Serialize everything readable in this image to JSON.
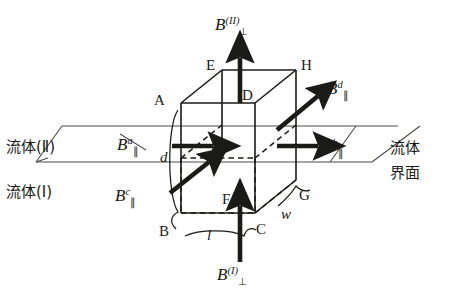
{
  "figure": {
    "ink_color": "#1a1a16"
  },
  "fields": {
    "perp_top": {
      "base": "B",
      "superscript": "(II)",
      "subscript": "⊥",
      "direction": "up"
    },
    "perp_bottom": {
      "base": "B",
      "superscript": "(I)",
      "subscript": "⊥",
      "direction": "up"
    },
    "par_a": {
      "base": "B",
      "superscript": "a",
      "subscript": "∥",
      "direction": "right"
    },
    "par_b": {
      "base": "B",
      "superscript": "b",
      "subscript": "∥",
      "direction": "right"
    },
    "par_c": {
      "base": "B",
      "superscript": "c",
      "subscript": "∥",
      "direction": "up-right"
    },
    "par_d": {
      "base": "B",
      "superscript": "d",
      "subscript": "∥",
      "direction": "up-right"
    }
  },
  "vertices": {
    "A": "A",
    "B": "B",
    "C": "C",
    "D": "D",
    "E": "E",
    "F": "F",
    "G": "G",
    "H": "H"
  },
  "dimensions": {
    "length": "l",
    "width": "w",
    "depth": "d"
  },
  "annotations": {
    "fluid_two": "流体(Ⅱ)",
    "fluid_one": "流体(Ⅰ)",
    "interface_line1": "流体",
    "interface_line2": "界面"
  }
}
